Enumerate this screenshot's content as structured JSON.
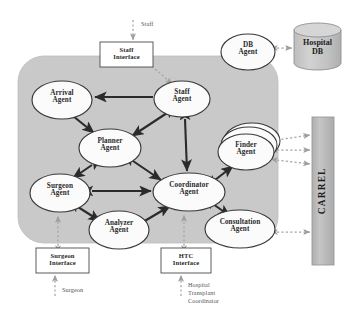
{
  "diagram": {
    "colors": {
      "panel_fill": "#c9c9c9",
      "node_fill": "#fbfbfb",
      "node_stroke": "#3a3a3a",
      "arrow_solid": "#2b2b2b",
      "arrow_dashed": "#a6a6a6",
      "carrel_fill": "#b9b9b9",
      "db_fill": "#c4c4c4",
      "page_bg": "#ffffff"
    },
    "platform_panel": {
      "name": "agent-platform-panel"
    },
    "agents": [
      {
        "id": "arrival",
        "label": "Arrival\nAgent",
        "cx": 62,
        "cy": 100,
        "rx": 30,
        "ry": 19,
        "stacked": false
      },
      {
        "id": "staff",
        "label": "Staff\nAgent",
        "cx": 182,
        "cy": 99,
        "rx": 28,
        "ry": 18,
        "stacked": false
      },
      {
        "id": "planner",
        "label": "Planner\nAgent",
        "cx": 110,
        "cy": 148,
        "rx": 31,
        "ry": 19,
        "stacked": false
      },
      {
        "id": "finder",
        "label": "Finder\nAgent",
        "cx": 246,
        "cy": 152,
        "rx": 28,
        "ry": 18,
        "stacked": true
      },
      {
        "id": "surgeon",
        "label": "Surgeon\nAgent",
        "cx": 60,
        "cy": 193,
        "rx": 30,
        "ry": 19,
        "stacked": false
      },
      {
        "id": "coordinator",
        "label": "Coordinator\nAgent",
        "cx": 189,
        "cy": 192,
        "rx": 36,
        "ry": 19,
        "stacked": false
      },
      {
        "id": "analyzer",
        "label": "Analyzer\nAgent",
        "cx": 119,
        "cy": 230,
        "rx": 30,
        "ry": 19,
        "stacked": false
      },
      {
        "id": "consultation",
        "label": "Consultation\nAgent",
        "cx": 240,
        "cy": 229,
        "rx": 35,
        "ry": 19,
        "stacked": false
      },
      {
        "id": "db",
        "label": "DB\nAgent",
        "cx": 248,
        "cy": 52,
        "rx": 27,
        "ry": 18,
        "stacked": false
      }
    ],
    "interfaces": [
      {
        "id": "staff-interface",
        "label": "Staff\nInterface",
        "x": 100,
        "y": 42,
        "w": 53,
        "h": 25
      },
      {
        "id": "surgeon-interface",
        "label": "Surgeon\nInterface",
        "x": 36,
        "y": 248,
        "w": 53,
        "h": 25
      },
      {
        "id": "htc-interface",
        "label": "HTC\nInterface",
        "x": 161,
        "y": 248,
        "w": 50,
        "h": 25
      }
    ],
    "external_actors": [
      {
        "id": "staff-actor",
        "label": "Staff",
        "x": 141,
        "y": 21,
        "w": 40,
        "align": "left"
      },
      {
        "id": "surgeon-actor",
        "label": "Surgeon",
        "x": 62,
        "y": 287,
        "w": 48,
        "align": "left"
      },
      {
        "id": "htc-actor",
        "label": "Hospital\nTransplant\nCoordinator",
        "x": 188,
        "y": 281,
        "w": 54,
        "align": "left"
      }
    ],
    "datastore": {
      "id": "hospital-db",
      "label": "Hospital\nDB",
      "x": 294,
      "y": 23,
      "w": 47,
      "h": 47,
      "ellipse_ry": 7
    },
    "carrel": {
      "id": "carrel-bar",
      "label": "CARREL",
      "x": 312,
      "y": 117,
      "w": 22,
      "h": 148
    },
    "connections": [
      {
        "from": "staff",
        "to": "arrival",
        "type": "solid",
        "heads": "one"
      },
      {
        "from": "arrival",
        "to": "planner",
        "type": "solid",
        "heads": "one"
      },
      {
        "from": "staff",
        "to": "planner",
        "type": "solid",
        "heads": "both"
      },
      {
        "from": "staff",
        "to": "coordinator",
        "type": "solid",
        "heads": "both"
      },
      {
        "from": "planner",
        "to": "surgeon",
        "type": "solid",
        "heads": "both"
      },
      {
        "from": "planner",
        "to": "coordinator",
        "type": "solid",
        "heads": "both"
      },
      {
        "from": "surgeon",
        "to": "coordinator",
        "type": "solid",
        "heads": "both"
      },
      {
        "from": "surgeon",
        "to": "analyzer",
        "type": "solid",
        "heads": "both"
      },
      {
        "from": "analyzer",
        "to": "coordinator",
        "type": "solid",
        "heads": "both"
      },
      {
        "from": "coordinator",
        "to": "finder",
        "type": "solid",
        "heads": "both"
      },
      {
        "from": "coordinator",
        "to": "consultation",
        "type": "solid",
        "heads": "both"
      },
      {
        "from": "staff-actor",
        "to": "staff-interface",
        "type": "dashed",
        "heads": "one"
      },
      {
        "from": "staff-interface",
        "to": "staff",
        "type": "dashed",
        "heads": "one"
      },
      {
        "from": "surgeon-actor",
        "to": "surgeon-interface",
        "type": "dashed",
        "heads": "one"
      },
      {
        "from": "surgeon-interface",
        "to": "surgeon",
        "type": "dashed",
        "heads": "both"
      },
      {
        "from": "htc-actor",
        "to": "htc-interface",
        "type": "dashed",
        "heads": "one"
      },
      {
        "from": "htc-interface",
        "to": "coordinator",
        "type": "dashed",
        "heads": "both"
      },
      {
        "from": "db",
        "to": "hospital-db",
        "type": "dashed",
        "heads": "both"
      },
      {
        "from": "finder",
        "to": "carrel",
        "type": "dashed",
        "heads": "both",
        "count": 3
      },
      {
        "from": "consultation",
        "to": "carrel",
        "type": "dashed",
        "heads": "both"
      }
    ]
  }
}
